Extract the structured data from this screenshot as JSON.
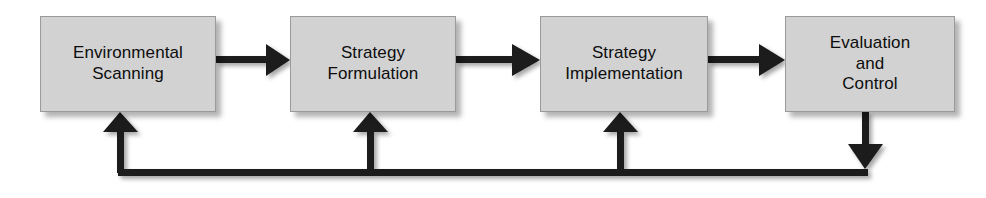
{
  "diagram": {
    "type": "process-flow-with-feedback",
    "background_color": "#ffffff",
    "box_fill_color": "#d2d2d2",
    "box_border_color": "#9a9a9a",
    "connector_color": "#1a1a1a",
    "text_color": "#0d0d0d",
    "stages": [
      {
        "id": "environmental-scanning",
        "label": "Environmental\nScanning",
        "line1": "Environmental",
        "line2": "Scanning",
        "x": 40,
        "y": 16,
        "width": 176,
        "height": 96
      },
      {
        "id": "strategy-formulation",
        "label": "Strategy\nFormulation",
        "line1": "Strategy",
        "line2": "Formulation",
        "x": 290,
        "y": 16,
        "width": 166,
        "height": 96
      },
      {
        "id": "strategy-implementation",
        "label": "Strategy\nImplementation",
        "line1": "Strategy",
        "line2": "Implementation",
        "x": 540,
        "y": 16,
        "width": 168,
        "height": 96
      },
      {
        "id": "evaluation-and-control",
        "label": "Evaluation\nand\nControl",
        "line1": "Evaluation",
        "line2": "and",
        "line3": "Control",
        "x": 785,
        "y": 16,
        "width": 170,
        "height": 96
      }
    ],
    "forward_arrows": [
      {
        "id": "arrow-scanning-to-formulation",
        "from": "environmental-scanning",
        "to": "strategy-formulation",
        "direction": "right"
      },
      {
        "id": "arrow-formulation-to-implementation",
        "from": "strategy-formulation",
        "to": "strategy-implementation",
        "direction": "right"
      },
      {
        "id": "arrow-implementation-to-evaluation",
        "from": "strategy-implementation",
        "to": "evaluation-and-control",
        "direction": "right"
      }
    ],
    "feedback_loop": {
      "id": "feedback-loop",
      "from": "evaluation-and-control",
      "description": "Feedback loop from Evaluation and Control back to all prior stages",
      "targets": [
        {
          "id": "feedback-arrow-to-scanning",
          "to": "environmental-scanning",
          "direction": "up"
        },
        {
          "id": "feedback-arrow-to-formulation",
          "to": "strategy-formulation",
          "direction": "up"
        },
        {
          "id": "feedback-arrow-to-implementation",
          "to": "strategy-implementation",
          "direction": "up"
        }
      ]
    }
  }
}
